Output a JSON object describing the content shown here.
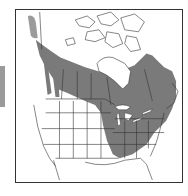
{
  "map": {
    "title": "Species range map",
    "region": "North America",
    "legend": {
      "range_label": "Range"
    },
    "colors": {
      "range_fill": "#7a7a7a",
      "land_fill": "#ffffff",
      "border_stroke": "#333333",
      "side_tab": "#9a9a9a",
      "water_highlight": "#ffffff"
    }
  }
}
